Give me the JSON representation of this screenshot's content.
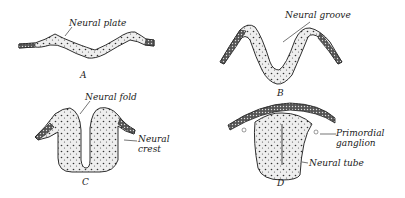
{
  "figure": {
    "panels": [
      {
        "id": "A",
        "letter": "A",
        "labels": [
          "Neural plate"
        ]
      },
      {
        "id": "B",
        "letter": "B",
        "labels": [
          "Neural groove"
        ]
      },
      {
        "id": "C",
        "letter": "C",
        "labels": [
          "Neural fold",
          "Neural crest"
        ]
      },
      {
        "id": "D",
        "letter": "D",
        "labels": [
          "Primordial ganglion",
          "Neural tube"
        ]
      }
    ],
    "labels": {
      "neural_plate": "Neural plate",
      "neural_groove": "Neural groove",
      "neural_fold": "Neural fold",
      "neural_crest_1": "Neural",
      "neural_crest_2": "crest",
      "primordial_ganglion_1": "Primordial",
      "primordial_ganglion_2": "ganglion",
      "neural_tube": "Neural tube"
    },
    "letters": {
      "a": "A",
      "b": "B",
      "c": "C",
      "d": "D"
    },
    "colors": {
      "ink": "#1a1a1a",
      "stipple_fill": "#e8e8e8",
      "background": "#ffffff"
    }
  }
}
